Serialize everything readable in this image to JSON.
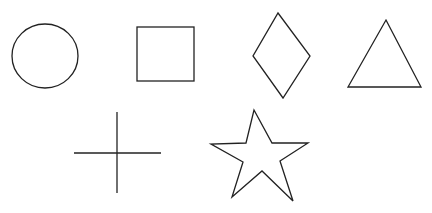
{
  "canvas": {
    "width": 432,
    "height": 213,
    "background": "#ffffff",
    "stroke": "#222222"
  },
  "shapes": [
    {
      "name": "circle",
      "label": "Circle"
    },
    {
      "name": "square",
      "label": "Square"
    },
    {
      "name": "diamond",
      "label": "Diamond"
    },
    {
      "name": "triangle",
      "label": "Triangle"
    },
    {
      "name": "cross",
      "label": "Cross"
    },
    {
      "name": "star",
      "label": "Star"
    }
  ]
}
